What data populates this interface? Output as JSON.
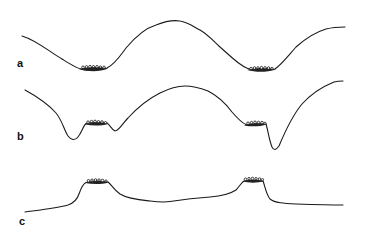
{
  "figure": {
    "type": "cross-section profiles",
    "line_color": "#1a1a1a",
    "background": "#ffffff",
    "panels": [
      {
        "label": "a",
        "description": "smooth undulating profile with two troughs containing deposits, central crest",
        "deposits": 2
      },
      {
        "label": "b",
        "description": "profile with deposits on shoulders flanked by deep incisions, central crest",
        "deposits": 2
      },
      {
        "label": "c",
        "description": "low-relief profile with two raised flat-topped mounds capped by deposits",
        "deposits": 2
      }
    ]
  }
}
